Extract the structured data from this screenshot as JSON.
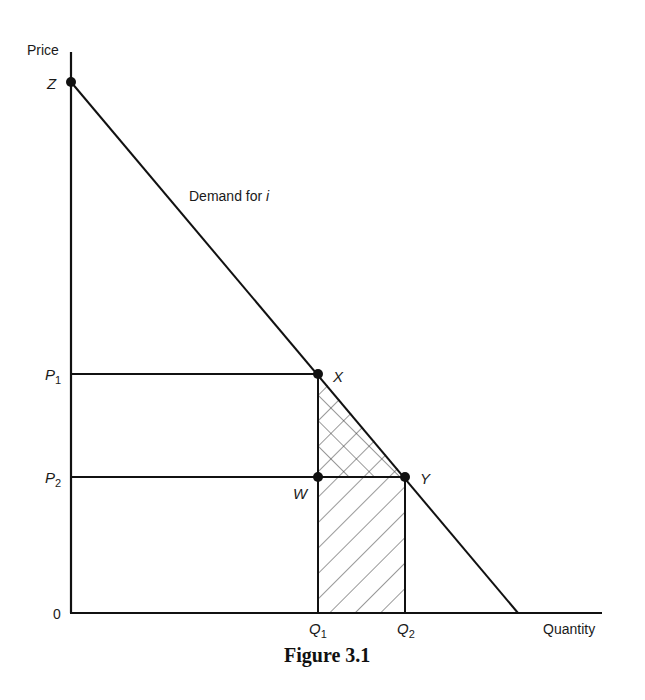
{
  "figure": {
    "caption": "Figure 3.1",
    "axes": {
      "y_label": "Price",
      "x_label": "Quantity",
      "origin_label": "0"
    },
    "curve": {
      "label_prefix": "Demand for ",
      "label_var": "i"
    },
    "points": {
      "Z": "Z",
      "X": "X",
      "W": "W",
      "Y": "Y"
    },
    "price_levels": {
      "P1": {
        "letter": "P",
        "sub": "1"
      },
      "P2": {
        "letter": "P",
        "sub": "2"
      }
    },
    "quantity_levels": {
      "Q1": {
        "letter": "Q",
        "sub": "1"
      },
      "Q2": {
        "letter": "Q",
        "sub": "2"
      }
    },
    "regions": {
      "triangle_XWY": "cross-hatched",
      "rectangle_W_Q1_Q2_Y": "single-hatched"
    }
  }
}
